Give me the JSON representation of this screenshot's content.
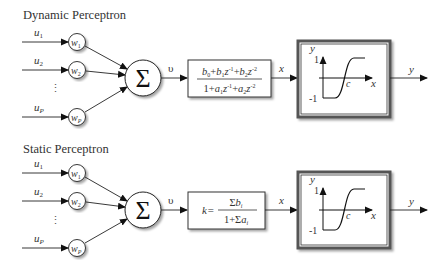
{
  "diagrams": [
    {
      "title": "Dynamic Perceptron",
      "inputs": [
        {
          "label": "u",
          "sub": "1",
          "weight": "w",
          "weight_sub": "1"
        },
        {
          "label": "u",
          "sub": "2",
          "weight": "w",
          "weight_sub": "2"
        },
        {
          "label": "u",
          "sub": "P",
          "weight": "w",
          "weight_sub": "P"
        }
      ],
      "ellipsis": "⋮",
      "summation_symbol": "Σ",
      "sum_output_label": "υ",
      "transfer_block": {
        "type": "dynamic",
        "numerator": "b0+b1z^-1+b2z^-2",
        "denominator": "1+a1z^-1+a2z^-2"
      },
      "transfer_output_label": "x",
      "activation": {
        "y_axis_label": "y",
        "x_axis_label": "x",
        "y_max": "1",
        "y_min": "-1",
        "center_label": "c"
      },
      "output_label": "y"
    },
    {
      "title": "Static Perceptron",
      "inputs": [
        {
          "label": "u",
          "sub": "1",
          "weight": "w",
          "weight_sub": "1"
        },
        {
          "label": "u",
          "sub": "2",
          "weight": "w",
          "weight_sub": "2"
        },
        {
          "label": "u",
          "sub": "P",
          "weight": "w",
          "weight_sub": "P"
        }
      ],
      "ellipsis": "⋮",
      "summation_symbol": "Σ",
      "sum_output_label": "υ",
      "transfer_block": {
        "type": "static",
        "gain_label": "k=",
        "numerator": "Σbi",
        "denominator": "1+Σai"
      },
      "transfer_output_label": "x",
      "activation": {
        "y_axis_label": "y",
        "x_axis_label": "x",
        "y_max": "1",
        "y_min": "-1",
        "center_label": "c"
      },
      "output_label": "y"
    }
  ]
}
